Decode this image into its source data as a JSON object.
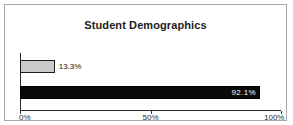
{
  "chart_data": {
    "type": "bar",
    "orientation": "horizontal",
    "title": "Student Demographics",
    "xlabel": "",
    "ylabel": "",
    "categories": [
      "series-1",
      "series-2"
    ],
    "values": [
      13.3,
      92.1
    ],
    "data_labels": [
      "13.3%",
      "92.1%"
    ],
    "xlim": [
      0,
      100
    ],
    "xticks": [
      0,
      50,
      100
    ],
    "xtick_labels": [
      "0%",
      "50%",
      "100%"
    ],
    "grid": false,
    "legend": false,
    "colors": {
      "bar_light_fill": "#c9c9c9",
      "bar_light_border": "#1e1e1e",
      "bar_dark_fill": "#0a0a0a",
      "axis": "#2b2b2b",
      "frame_border": "#a8a8a8",
      "background": "#ffffff",
      "label_dark": "#141414",
      "label_light": "#ffffff"
    }
  },
  "frame": {
    "title": "Student Demographics"
  },
  "axis": {
    "ticks": [
      {
        "label": "0%",
        "value": 0
      },
      {
        "label": "50%",
        "value": 50
      },
      {
        "label": "100%",
        "value": 100
      }
    ]
  },
  "bars": [
    {
      "label": "13.3%",
      "value": 13.3,
      "style": "light"
    },
    {
      "label": "92.1%",
      "value": 92.1,
      "style": "dark"
    }
  ]
}
